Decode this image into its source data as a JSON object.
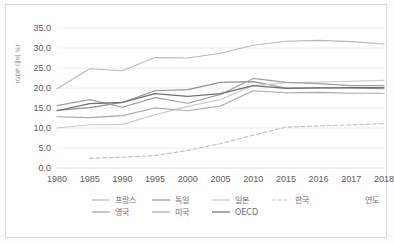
{
  "chart_data": {
    "type": "line",
    "title": "",
    "xlabel": "연도",
    "ylabel": "(GDP 대비 %)",
    "x": [
      1980,
      1985,
      1990,
      1995,
      2000,
      2005,
      2010,
      2015,
      2016,
      2017,
      2018
    ],
    "xtick_labels": [
      "1980",
      "1985",
      "1990",
      "1995",
      "2000",
      "2005",
      "2010",
      "2015",
      "2016",
      "2017",
      "2018"
    ],
    "ytick_labels": [
      "0.0",
      "5.0",
      "10.0",
      "15.0",
      "20.0",
      "25.0",
      "30.0",
      "35.0"
    ],
    "yticks": [
      0.0,
      5.0,
      10.0,
      15.0,
      20.0,
      25.0,
      30.0,
      35.0
    ],
    "ylim": [
      0.0,
      35.0
    ],
    "grid": true,
    "legend_position": "bottom",
    "series": [
      {
        "name": "프랑스",
        "color": "#b8b8b8",
        "style": "solid",
        "values": [
          19.8,
          24.8,
          24.3,
          27.6,
          27.5,
          28.7,
          30.7,
          31.7,
          31.9,
          31.6,
          31.0
        ]
      },
      {
        "name": "독일",
        "color": "#8f8f8f",
        "style": "solid",
        "values": [
          14.4,
          15.1,
          16.4,
          19.3,
          19.6,
          21.4,
          21.6,
          20.0,
          20.1,
          20.0,
          19.8
        ]
      },
      {
        "name": "일본",
        "color": "#c9c9c9",
        "style": "solid",
        "values": [
          10.0,
          10.8,
          10.9,
          13.3,
          15.4,
          17.1,
          20.6,
          21.3,
          21.5,
          21.7,
          21.9
        ]
      },
      {
        "name": "한국",
        "color": "#bfbfbf",
        "style": "dashed",
        "values": [
          null,
          2.4,
          2.7,
          3.1,
          4.4,
          6.1,
          8.2,
          10.2,
          10.5,
          10.8,
          11.1
        ]
      },
      {
        "name": "영국",
        "color": "#9e9e9e",
        "style": "solid",
        "values": [
          15.6,
          17.1,
          15.2,
          17.6,
          16.2,
          18.4,
          22.4,
          21.4,
          21.1,
          20.6,
          20.6
        ]
      },
      {
        "name": "미국",
        "color": "#a8a8a8",
        "style": "solid",
        "values": [
          12.8,
          12.6,
          13.1,
          15.0,
          14.3,
          15.5,
          19.3,
          18.8,
          18.9,
          18.7,
          18.7
        ]
      },
      {
        "name": "OECD",
        "color": "#6f6f6f",
        "style": "solid",
        "values": [
          14.3,
          16.1,
          16.4,
          18.6,
          17.9,
          18.6,
          20.6,
          19.9,
          20.0,
          20.1,
          20.1
        ]
      }
    ]
  },
  "legend": {
    "row1": [
      "프랑스",
      "독일",
      "일본",
      "한국"
    ],
    "row2": [
      "영국",
      "미국",
      "OECD"
    ],
    "xaxis_caption": "연도"
  }
}
